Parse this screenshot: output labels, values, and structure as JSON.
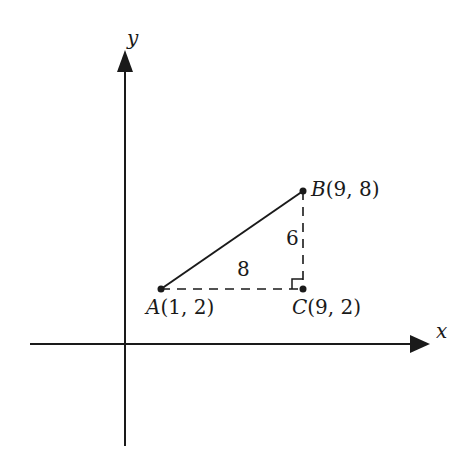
{
  "axes": {
    "x_label": "x",
    "y_label": "y"
  },
  "points": {
    "A": {
      "name": "A",
      "coords": "(1, 2)"
    },
    "B": {
      "name": "B",
      "coords": "(9, 8)"
    },
    "C": {
      "name": "C",
      "coords": "(9, 2)"
    }
  },
  "segments": {
    "horizontal_length": "8",
    "vertical_length": "6"
  },
  "colors": {
    "ink": "#1a1a1a",
    "background": "#ffffff"
  }
}
